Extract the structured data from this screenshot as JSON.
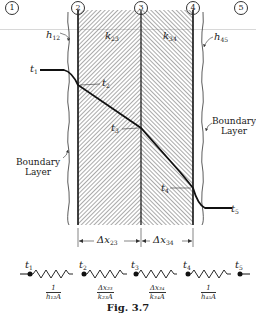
{
  "figure": {
    "caption": "Fig. 3.7",
    "nodes": [
      {
        "id": "1",
        "label": "1",
        "x": 12
      },
      {
        "id": "2",
        "label": "2",
        "x": 78
      },
      {
        "id": "3",
        "label": "3",
        "x": 141
      },
      {
        "id": "4",
        "label": "4",
        "x": 193
      },
      {
        "id": "5",
        "label": "5",
        "x": 240
      }
    ],
    "coefficients": {
      "h12": {
        "base": "h",
        "sub": "12"
      },
      "k23": {
        "base": "k",
        "sub": "23"
      },
      "k34": {
        "base": "k",
        "sub": "34"
      },
      "h45": {
        "base": "h",
        "sub": "45"
      }
    },
    "temperatures": [
      {
        "base": "t",
        "sub": "1"
      },
      {
        "base": "t",
        "sub": "2"
      },
      {
        "base": "t",
        "sub": "3"
      },
      {
        "base": "t",
        "sub": "4"
      },
      {
        "base": "t",
        "sub": "5"
      }
    ],
    "boundary_layer_left": {
      "line1": "Boundary",
      "line2": "Layer"
    },
    "boundary_layer_right": {
      "line1": "Boundary",
      "line2": "Layer"
    },
    "dimensions": [
      {
        "base": "Δx",
        "sub": "23"
      },
      {
        "base": "Δx",
        "sub": "34"
      }
    ],
    "resistances": [
      {
        "num": "1",
        "den": "h₁₂A"
      },
      {
        "num": "Δx₂₃",
        "den": "k₂₃A"
      },
      {
        "num": "Δx₃₄",
        "den": "k₃₄A"
      },
      {
        "num": "1",
        "den": "h₄₅A"
      }
    ],
    "colors": {
      "ink": "#1a1a1a",
      "hatch": "#555555",
      "background": "#ffffff"
    }
  }
}
